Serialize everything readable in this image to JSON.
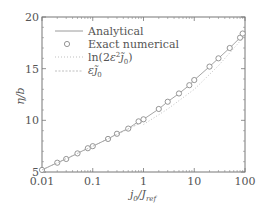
{
  "chart_data": {
    "type": "line",
    "title": "",
    "xlabel": "j0/Jref",
    "xlabel_parts": {
      "main": "j",
      "sub0": "0",
      "sep": "/J",
      "sub1": "ref"
    },
    "ylabel": "η/b",
    "xscale": "log",
    "xlim": [
      0.01,
      100
    ],
    "ylim": [
      5,
      20
    ],
    "x_ticks": [
      0.01,
      0.1,
      1,
      10,
      100
    ],
    "x_tick_labels": [
      "0.01",
      "0.1",
      "1",
      "10",
      "100"
    ],
    "y_ticks": [
      5,
      10,
      15,
      20
    ],
    "y_tick_labels": [
      "5",
      "10",
      "15",
      "20"
    ],
    "grid": false,
    "legend_position": "upper left",
    "legend": [
      {
        "label": "Analytical",
        "style": "solid"
      },
      {
        "label": "Exact numerical",
        "style": "circle"
      },
      {
        "label": "ln(2ε²j̃0)",
        "style": "dotted"
      },
      {
        "label": "εj̃0",
        "style": "dashed"
      }
    ],
    "series": [
      {
        "name": "Analytical",
        "style": "solid",
        "x": [
          0.01,
          0.02,
          0.03,
          0.05,
          0.08,
          0.1,
          0.2,
          0.3,
          0.5,
          0.8,
          1,
          2,
          3,
          5,
          8,
          10,
          20,
          30,
          50,
          80,
          100
        ],
        "y": [
          5.2,
          5.9,
          6.26,
          6.8,
          7.3,
          7.5,
          8.2,
          8.7,
          9.2,
          9.9,
          10.1,
          11.1,
          11.8,
          12.6,
          13.4,
          13.9,
          15.2,
          16.0,
          17.0,
          18.0,
          18.6
        ]
      },
      {
        "name": "Exact numerical",
        "style": "circle",
        "x": [
          0.01,
          0.02,
          0.03,
          0.05,
          0.08,
          0.1,
          0.2,
          0.3,
          0.5,
          0.8,
          1,
          2,
          3,
          5,
          8,
          10,
          20,
          30,
          50,
          80,
          90
        ],
        "y": [
          5.2,
          5.9,
          6.26,
          6.8,
          7.3,
          7.5,
          8.2,
          8.7,
          9.2,
          9.9,
          10.1,
          11.1,
          11.8,
          12.6,
          13.4,
          13.9,
          15.2,
          16.0,
          17.0,
          18.0,
          18.4
        ]
      },
      {
        "name": "ln(2ε²j̃0)",
        "style": "dotted",
        "x": [
          1,
          3,
          10,
          30,
          100
        ],
        "y": [
          9.6,
          11.1,
          13.0,
          15.3,
          18.2
        ]
      },
      {
        "name": "εj̃0",
        "style": "dashed",
        "x": [
          0.01,
          0.1,
          1
        ],
        "y": [
          5.2,
          7.5,
          9.9
        ]
      }
    ]
  },
  "colors": {
    "axis": "#777777",
    "line": "#9a9a9a",
    "marker": "#8a8a8a",
    "dotted": "#b0b0b0"
  }
}
